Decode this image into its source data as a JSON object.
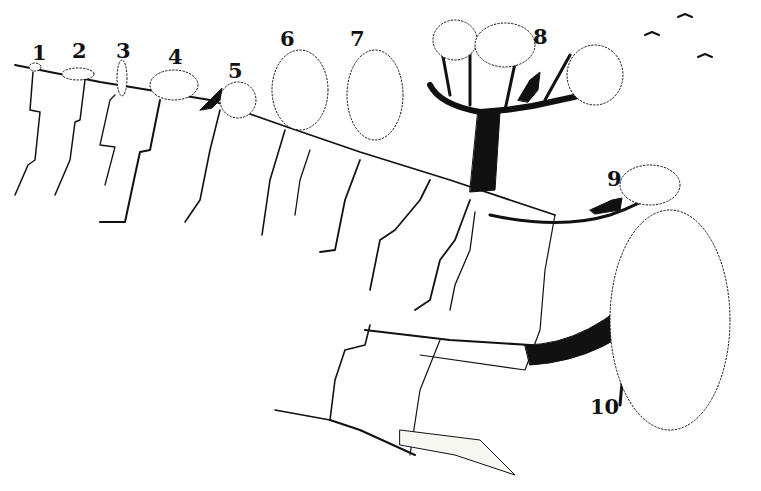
{
  "figure": {
    "ink_color": "#111111",
    "background_color": "#ffffff",
    "labels": [
      {
        "text": "1",
        "x": 32,
        "y": 42
      },
      {
        "text": "2",
        "x": 72,
        "y": 40
      },
      {
        "text": "3",
        "x": 116,
        "y": 40
      },
      {
        "text": "4",
        "x": 168,
        "y": 46
      },
      {
        "text": "5",
        "x": 228,
        "y": 60
      },
      {
        "text": "6",
        "x": 280,
        "y": 28
      },
      {
        "text": "7",
        "x": 350,
        "y": 28
      },
      {
        "text": "8",
        "x": 533,
        "y": 26
      },
      {
        "text": "9",
        "x": 607,
        "y": 168
      },
      {
        "text": "10",
        "x": 590,
        "y": 396
      }
    ],
    "animals": [
      "goat-near-5",
      "goat-in-tree-8",
      "goat-on-branch-9"
    ],
    "birds": 3
  }
}
